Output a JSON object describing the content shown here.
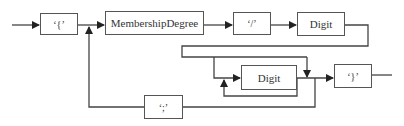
{
  "diagram": {
    "type": "syntax-diagram",
    "line_color": "#444444",
    "nodes": [
      {
        "id": "open_brace",
        "label": "‘{’",
        "kind": "terminal"
      },
      {
        "id": "membership_degree",
        "label": "MembershipDegree",
        "kind": "nonterminal"
      },
      {
        "id": "slash",
        "label": "‘/’",
        "kind": "terminal"
      },
      {
        "id": "digit_top",
        "label": "Digit",
        "kind": "nonterminal"
      },
      {
        "id": "digit_loop",
        "label": "Digit",
        "kind": "nonterminal"
      },
      {
        "id": "semicolon",
        "label": "‘;’",
        "kind": "terminal"
      },
      {
        "id": "close_brace",
        "label": "‘}’",
        "kind": "terminal"
      }
    ],
    "edges": [
      {
        "from": "start",
        "to": "open_brace"
      },
      {
        "from": "open_brace",
        "to": "membership_degree"
      },
      {
        "from": "membership_degree",
        "to": "slash"
      },
      {
        "from": "slash",
        "to": "digit_top"
      },
      {
        "from": "digit_top",
        "to": "digit_loop"
      },
      {
        "from": "digit_top",
        "to": "close_brace",
        "note": "bypass"
      },
      {
        "from": "digit_loop",
        "to": "digit_loop",
        "note": "repeat"
      },
      {
        "from": "digit_loop",
        "to": "close_brace"
      },
      {
        "from": "digit_loop",
        "to": "semicolon"
      },
      {
        "from": "semicolon",
        "to": "membership_degree",
        "note": "loop back"
      },
      {
        "from": "close_brace",
        "to": "end"
      }
    ]
  }
}
